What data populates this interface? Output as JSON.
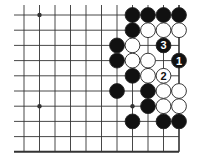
{
  "diagram": {
    "type": "go-board-fragment",
    "columns_x": [
      24,
      39.5,
      55,
      70.5,
      86,
      101.5,
      117,
      132.5,
      148,
      163.5,
      179
    ],
    "rows_y": [
      15,
      30.2,
      45.4,
      60.6,
      75.8,
      91,
      106.2,
      121.4,
      136.6,
      151.8
    ],
    "edges": {
      "right": true,
      "bottom": true,
      "top": false,
      "left": false
    },
    "colors": {
      "line": "#333333",
      "black_stone": "#111111",
      "white_stone": "#ffffff",
      "stone_outline": "#222222"
    },
    "star_points": [
      {
        "col": 1,
        "row": 0
      },
      {
        "col": 1,
        "row": 6
      },
      {
        "col": 7,
        "row": 6
      }
    ],
    "stones": [
      {
        "col": 7,
        "row": 0,
        "color": "black",
        "label": ""
      },
      {
        "col": 8,
        "row": 0,
        "color": "black",
        "label": ""
      },
      {
        "col": 9,
        "row": 0,
        "color": "black",
        "label": ""
      },
      {
        "col": 10,
        "row": 0,
        "color": "black",
        "label": ""
      },
      {
        "col": 7,
        "row": 1,
        "color": "black",
        "label": ""
      },
      {
        "col": 8,
        "row": 1,
        "color": "white",
        "label": ""
      },
      {
        "col": 9,
        "row": 1,
        "color": "white",
        "label": ""
      },
      {
        "col": 10,
        "row": 1,
        "color": "white",
        "label": ""
      },
      {
        "col": 6,
        "row": 2,
        "color": "black",
        "label": ""
      },
      {
        "col": 7,
        "row": 2,
        "color": "white",
        "label": ""
      },
      {
        "col": 9,
        "row": 2,
        "color": "black",
        "label": "3"
      },
      {
        "col": 6,
        "row": 3,
        "color": "black",
        "label": ""
      },
      {
        "col": 7,
        "row": 3,
        "color": "white",
        "label": ""
      },
      {
        "col": 8,
        "row": 3,
        "color": "white",
        "label": ""
      },
      {
        "col": 10,
        "row": 3,
        "color": "black",
        "label": "1"
      },
      {
        "col": 7,
        "row": 4,
        "color": "black",
        "label": ""
      },
      {
        "col": 8,
        "row": 4,
        "color": "white",
        "label": ""
      },
      {
        "col": 9,
        "row": 4,
        "color": "white",
        "label": "2"
      },
      {
        "col": 6,
        "row": 5,
        "color": "black",
        "label": ""
      },
      {
        "col": 8,
        "row": 5,
        "color": "black",
        "label": ""
      },
      {
        "col": 9,
        "row": 5,
        "color": "white",
        "label": ""
      },
      {
        "col": 10,
        "row": 5,
        "color": "white",
        "label": ""
      },
      {
        "col": 8,
        "row": 6,
        "color": "black",
        "label": ""
      },
      {
        "col": 9,
        "row": 6,
        "color": "white",
        "label": ""
      },
      {
        "col": 10,
        "row": 6,
        "color": "white",
        "label": ""
      },
      {
        "col": 7,
        "row": 7,
        "color": "black",
        "label": ""
      },
      {
        "col": 9,
        "row": 7,
        "color": "black",
        "label": ""
      },
      {
        "col": 10,
        "row": 7,
        "color": "black",
        "label": ""
      }
    ]
  }
}
